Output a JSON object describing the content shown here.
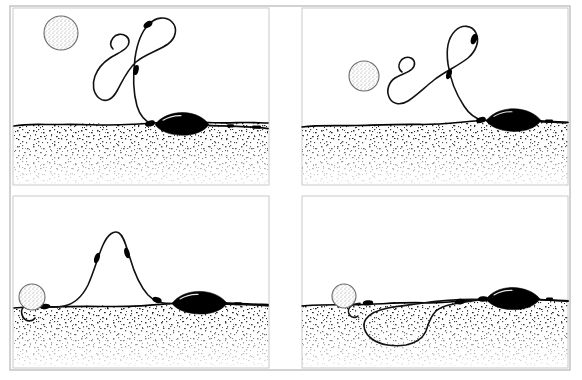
{
  "figure": {
    "title": "Carp rig sequence — buoyant bait on hooklink above lead on lakebed",
    "panel_count": 4,
    "background_color": "#ffffff",
    "ink_color": "#000000",
    "frame_color": "#c9c9c9",
    "substrate_color": "#3a3a3a"
  },
  "panels": [
    {
      "id": "panel-top-left",
      "position": "top-left",
      "label": "",
      "description": "Long hooklink: bait sits high in the water with a tall S-curve of line rising from the lead.",
      "elements": {
        "bait": {
          "name": "buoyant-bait",
          "shape": "stippled-circle",
          "radius_px": 17,
          "center": [
            61,
            33
          ]
        },
        "lead": {
          "name": "lead-weight",
          "shape": "elongated-teardrop",
          "center": [
            182,
            125
          ],
          "length_px": 58
        },
        "waterline_y": 124,
        "hooklink_length": "long",
        "tube_segments": 2
      }
    },
    {
      "id": "panel-top-right",
      "position": "top-right",
      "label": "",
      "description": "Medium-long hooklink: bait lower, single tall arch of line from the lead.",
      "elements": {
        "bait": {
          "name": "buoyant-bait",
          "shape": "stippled-circle",
          "radius_px": 15,
          "center": [
            364,
            76
          ]
        },
        "lead": {
          "name": "lead-weight",
          "shape": "elongated-teardrop",
          "center": [
            514,
            121
          ],
          "length_px": 58
        },
        "waterline_y": 123,
        "hooklink_length": "medium-long",
        "tube_segments": 2
      }
    },
    {
      "id": "panel-bottom-left",
      "position": "bottom-left",
      "label": "",
      "description": "Short hooklink: bait rests on the lakebed, slack line rises in a narrow loop.",
      "elements": {
        "bait": {
          "name": "buoyant-bait",
          "shape": "stippled-circle",
          "radius_px": 13,
          "center": [
            32,
            297
          ]
        },
        "lead": {
          "name": "lead-weight",
          "shape": "elongated-teardrop",
          "center": [
            199,
            303
          ],
          "length_px": 58
        },
        "waterline_y": 306,
        "hooklink_length": "short",
        "tube_segments": 2
      }
    },
    {
      "id": "panel-bottom-right",
      "position": "bottom-right",
      "label": "",
      "description": "Slack hooklink: bait on the bed, surplus line lying as a loop buried in the substrate.",
      "elements": {
        "bait": {
          "name": "buoyant-bait",
          "shape": "stippled-circle",
          "radius_px": 12,
          "center": [
            344,
            296
          ]
        },
        "lead": {
          "name": "lead-weight",
          "shape": "elongated-teardrop",
          "center": [
            513,
            299
          ],
          "length_px": 56
        },
        "waterline_y": 304,
        "hooklink_length": "slack-loop",
        "tube_segments": 2
      }
    }
  ]
}
